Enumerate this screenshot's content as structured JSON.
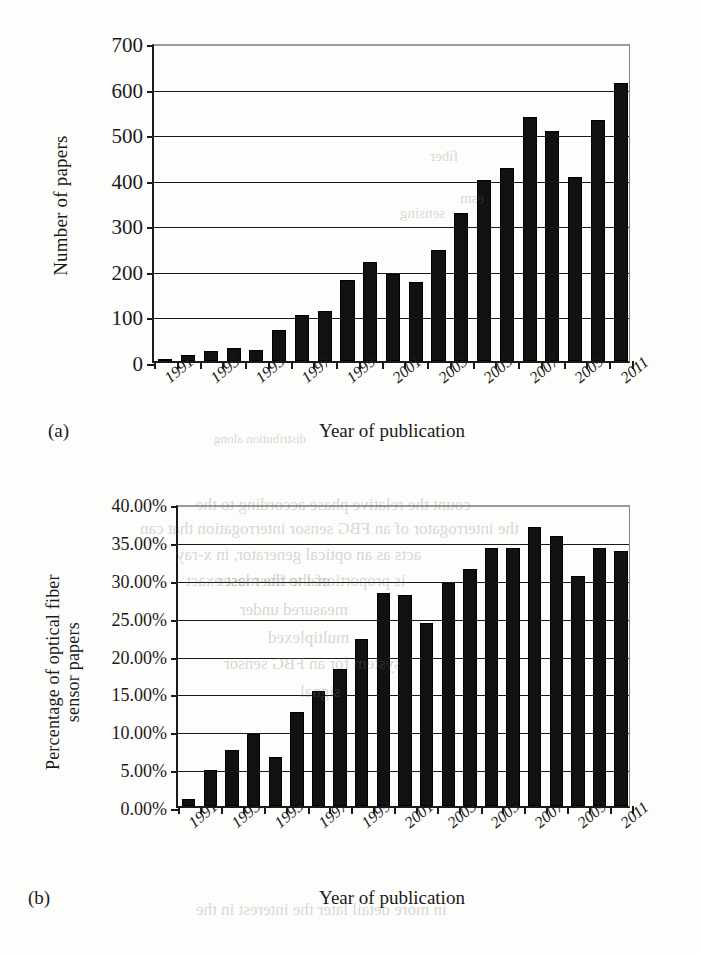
{
  "figure": {
    "panels": [
      {
        "letter": "(a)",
        "xtitle": "Year of publication",
        "ytitle_lines": [
          "Number of papers"
        ]
      },
      {
        "letter": "(b)",
        "xtitle": "Year of publication",
        "ytitle_lines": [
          "Percentage of optical fiber",
          "sensor papers"
        ]
      }
    ]
  },
  "chart_data": [
    {
      "type": "bar",
      "title": "",
      "xlabel": "Year of publication",
      "ylabel": "Number of papers",
      "categories": [
        1991,
        1992,
        1993,
        1994,
        1995,
        1996,
        1997,
        1998,
        1999,
        2000,
        2001,
        2002,
        2003,
        2004,
        2005,
        2006,
        2007,
        2008,
        2009,
        2010,
        2011
      ],
      "tick_labels": [
        "1991",
        "1993",
        "1995",
        "1997",
        "1999",
        "2001",
        "2003",
        "2005",
        "2007",
        "2009",
        "2011"
      ],
      "values": [
        3,
        14,
        21,
        28,
        24,
        68,
        100,
        110,
        178,
        218,
        191,
        174,
        243,
        324,
        397,
        423,
        535,
        504,
        403,
        528,
        611
      ],
      "ytick_labels": [
        "0",
        "100",
        "200",
        "300",
        "400",
        "500",
        "600",
        "700"
      ],
      "ytick_values": [
        0,
        100,
        200,
        300,
        400,
        500,
        600,
        700
      ],
      "ylim": [
        0,
        700
      ],
      "grid": true,
      "legend": "none",
      "bar_color": "#111111"
    },
    {
      "type": "bar",
      "title": "",
      "xlabel": "Year of publication",
      "ylabel": "Percentage of optical fiber sensor papers",
      "categories": [
        1991,
        1992,
        1993,
        1994,
        1995,
        1996,
        1997,
        1998,
        1999,
        2000,
        2001,
        2002,
        2003,
        2004,
        2005,
        2006,
        2007,
        2008,
        2009,
        2010,
        2011
      ],
      "tick_labels": [
        "1991",
        "1993",
        "1995",
        "1997",
        "1999",
        "2001",
        "2003",
        "2005",
        "2007",
        "2009",
        "2011"
      ],
      "values": [
        0.9,
        4.7,
        7.4,
        9.5,
        6.5,
        12.4,
        15.2,
        18.1,
        22.0,
        28.1,
        27.9,
        24.1,
        29.4,
        31.3,
        34.0,
        34.0,
        36.8,
        35.7,
        30.4,
        34.1,
        33.7
      ],
      "ytick_labels": [
        "0.00%",
        "5.00%",
        "10.00%",
        "15.00%",
        "20.00%",
        "25.00%",
        "30.00%",
        "35.00%",
        "40.00%"
      ],
      "ytick_values": [
        0,
        5,
        10,
        15,
        20,
        25,
        30,
        35,
        40
      ],
      "ylim": [
        0,
        40
      ],
      "grid": true,
      "legend": "none",
      "bar_color": "#111111"
    }
  ],
  "bleed_text": [
    {
      "t": "distribution along",
      "x": 214,
      "y": 431,
      "s": 13
    },
    {
      "t": "count the relative phase according to the",
      "x": 196,
      "y": 495,
      "s": 17
    },
    {
      "t": "the interrogator of an FBG sensor interrogation that can",
      "x": 140,
      "y": 519,
      "s": 17
    },
    {
      "t": "acts as an optical generator, in x-ray",
      "x": 176,
      "y": 545,
      "s": 17
    },
    {
      "t": "of the fiber laser",
      "x": 218,
      "y": 571,
      "s": 17
    },
    {
      "t": "is proportional to the most exact",
      "x": 186,
      "y": 571,
      "s": 17
    },
    {
      "t": "measured under",
      "x": 240,
      "y": 600,
      "s": 17
    },
    {
      "t": "multiplexed",
      "x": 268,
      "y": 628,
      "s": 17
    },
    {
      "t": "system for an FBG sensor",
      "x": 224,
      "y": 654,
      "s": 17
    },
    {
      "t": "signal",
      "x": 300,
      "y": 682,
      "s": 17
    },
    {
      "t": "fiber",
      "x": 430,
      "y": 148,
      "s": 15
    },
    {
      "t": "sensing",
      "x": 400,
      "y": 205,
      "s": 15
    },
    {
      "t": "esm",
      "x": 460,
      "y": 190,
      "s": 15
    },
    {
      "t": "in more detail later the interest in the",
      "x": 196,
      "y": 900,
      "s": 17
    }
  ]
}
